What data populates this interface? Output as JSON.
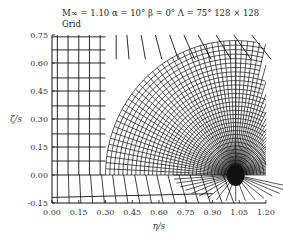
{
  "header": {
    "title": "M∞ = 1.10   α = 10°   β = 0°   Λ = 75°   128 × 128",
    "subtitle": "Grid"
  },
  "chart_data": {
    "type": "diagram",
    "title": "M∞ = 1.10  α = 10°  β = 0°  Λ = 75°  128 × 128",
    "subtitle": "Grid",
    "xlabel": "η/s",
    "ylabel": "ζ/s",
    "xlim": [
      0.0,
      1.2
    ],
    "ylim": [
      -0.15,
      0.75
    ],
    "xticks": [
      "0.00",
      "0.15",
      "0.30",
      "0.45",
      "0.60",
      "0.75",
      "0.90",
      "1.05",
      "1.20"
    ],
    "yticks": [
      "0.75",
      "0.60",
      "0.45",
      "0.30",
      "0.15",
      "0.00",
      "-0.15"
    ],
    "dense_center": [
      1.03,
      0.0
    ],
    "dense_extent": {
      "eta_min": 0.3,
      "zeta_max": 0.72
    }
  },
  "axes": {
    "xlabel": "η/s",
    "ylabel": "ζ/s",
    "xticks": [
      "0.00",
      "0.15",
      "0.30",
      "0.45",
      "0.60",
      "0.75",
      "0.90",
      "1.05",
      "1.20"
    ],
    "yticks": [
      "0.75",
      "0.60",
      "0.45",
      "0.30",
      "0.15",
      "0.00",
      "-0.15"
    ]
  }
}
